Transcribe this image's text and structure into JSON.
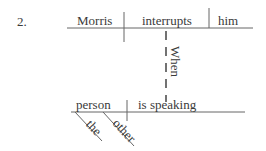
{
  "item_number": "2.",
  "main_clause": {
    "subject": "Morris",
    "verb": "interrupts",
    "object": "him"
  },
  "connector": "When",
  "subordinate_clause": {
    "subject": "person",
    "verb": "is speaking",
    "modifiers": [
      "the",
      "other"
    ]
  },
  "colors": {
    "line": "#555555",
    "text": "#3a3a3a"
  }
}
